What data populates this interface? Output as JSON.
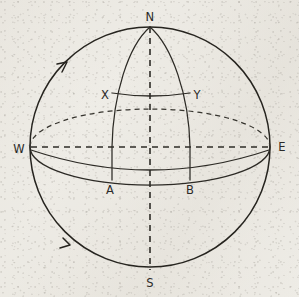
{
  "figure": {
    "background_color": "#edebe5",
    "ink_color": "#2b2a28",
    "labels": {
      "north_pole": "N",
      "south_pole": "S",
      "west": "W",
      "east": "E",
      "upper_left_vertex": "X",
      "upper_right_vertex": "Y",
      "lower_left_vertex": "A",
      "lower_right_vertex": "B"
    },
    "label_positions": [
      {
        "name": "north-pole-label",
        "text": "N",
        "x": 150,
        "y": 17
      },
      {
        "name": "south-pole-label",
        "text": "S",
        "x": 150,
        "y": 283
      },
      {
        "name": "west-label",
        "text": "W",
        "x": 19,
        "y": 149
      },
      {
        "name": "east-label",
        "text": "E",
        "x": 282,
        "y": 147
      },
      {
        "name": "upper-left-vertex-label",
        "text": "X",
        "x": 105,
        "y": 95
      },
      {
        "name": "upper-right-vertex-label",
        "text": "Y",
        "x": 196,
        "y": 95
      },
      {
        "name": "lower-left-vertex-label",
        "text": "A",
        "x": 110,
        "y": 190
      },
      {
        "name": "lower-right-vertex-label",
        "text": "B",
        "x": 190,
        "y": 190
      }
    ],
    "geometry": {
      "sphere_center_x": 150,
      "sphere_center_y": 147,
      "sphere_radius": 120,
      "equator_rx": 120,
      "equator_ry": 38,
      "lune_left_meridian_bottom_x": 112,
      "lune_right_meridian_bottom_x": 190,
      "xy_arc_y": 94,
      "ab_arc_y": 180
    },
    "elements": [
      {
        "name": "sphere-outline",
        "kind": "circle",
        "style": "solid"
      },
      {
        "name": "equator-back-half",
        "kind": "ellipse-arc",
        "style": "dashed"
      },
      {
        "name": "equator-front-half",
        "kind": "ellipse-arc",
        "style": "solid"
      },
      {
        "name": "polar-axis",
        "kind": "line",
        "style": "dashed"
      },
      {
        "name": "west-east-axis",
        "kind": "line",
        "style": "dashed"
      },
      {
        "name": "lune-left-meridian",
        "kind": "curve",
        "style": "solid"
      },
      {
        "name": "lune-right-meridian",
        "kind": "curve",
        "style": "solid"
      },
      {
        "name": "xy-arc",
        "kind": "arc",
        "style": "solid"
      },
      {
        "name": "ab-arc",
        "kind": "arc",
        "style": "solid"
      },
      {
        "name": "rotation-tick-upper-left",
        "kind": "tick",
        "style": "solid"
      },
      {
        "name": "rotation-tick-lower-left",
        "kind": "tick",
        "style": "solid"
      }
    ]
  }
}
